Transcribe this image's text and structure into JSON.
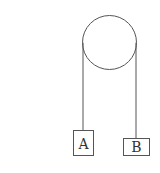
{
  "diagram": {
    "type": "pulley-system",
    "pulley": {
      "label": ""
    },
    "blocks": [
      {
        "id": "A",
        "label": "A"
      },
      {
        "id": "B",
        "label": "B"
      }
    ],
    "colors": {
      "line": "#555555",
      "text": "#333333",
      "background": "#ffffff"
    }
  }
}
